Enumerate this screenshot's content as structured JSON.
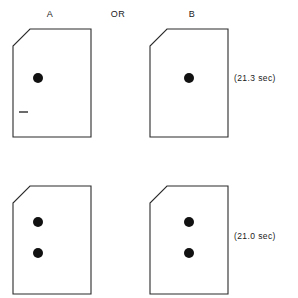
{
  "figure": {
    "background_color": "#ffffff",
    "ink_color": "#2b2b2b",
    "dot_color": "#111111"
  },
  "headers": {
    "left_label": "A",
    "connector_label": "OR",
    "right_label": "B"
  },
  "rows": [
    {
      "row_id": "row-1",
      "time_label": "(21.3 sec)",
      "cards": [
        {
          "card_id": "card-top-left",
          "column": "A",
          "dot_count": 1,
          "dots": [
            {
              "cx": 26,
              "cy": 50,
              "r": 5
            }
          ],
          "has_tick_mark": true,
          "tick_mark": {
            "x1": 7,
            "y1": 84,
            "x2": 16,
            "y2": 84
          }
        },
        {
          "card_id": "card-top-right",
          "column": "B",
          "dot_count": 1,
          "dots": [
            {
              "cx": 40,
              "cy": 50,
              "r": 5
            }
          ],
          "has_tick_mark": false,
          "tick_mark": null
        }
      ]
    },
    {
      "row_id": "row-2",
      "time_label": "(21.0 sec)",
      "cards": [
        {
          "card_id": "card-bottom-left",
          "column": "A",
          "dot_count": 2,
          "dots": [
            {
              "cx": 26,
              "cy": 37,
              "r": 5
            },
            {
              "cx": 26,
              "cy": 68,
              "r": 5
            }
          ],
          "has_tick_mark": false,
          "tick_mark": null
        },
        {
          "card_id": "card-bottom-right",
          "column": "B",
          "dot_count": 2,
          "dots": [
            {
              "cx": 40,
              "cy": 37,
              "r": 5
            },
            {
              "cx": 40,
              "cy": 68,
              "r": 5
            }
          ],
          "has_tick_mark": false,
          "tick_mark": null
        }
      ]
    }
  ],
  "card_shape": {
    "description": "rectangle with beveled (chamfered) top-left corner",
    "width": 80,
    "height": 110,
    "bevel_size": 17,
    "path": "M 18 1 L 79 1 L 79 109 L 1 109 L 1 18 Z"
  }
}
